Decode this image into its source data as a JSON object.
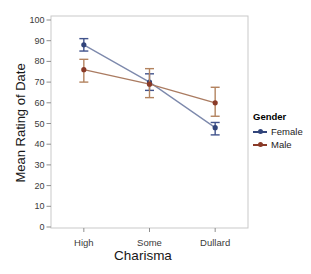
{
  "chart_data": {
    "type": "line",
    "title": "",
    "xlabel": "Charisma",
    "ylabel": "Mean Rating of Date",
    "categories": [
      "High",
      "Some",
      "Dullard"
    ],
    "ylim": [
      0,
      100
    ],
    "yticks": [
      0,
      10,
      20,
      30,
      40,
      50,
      60,
      70,
      80,
      90,
      100
    ],
    "grid": false,
    "legend": {
      "title": "Gender",
      "position": "right-outside"
    },
    "series": [
      {
        "name": "Female",
        "values": [
          88,
          70,
          48
        ],
        "ci_low": [
          85,
          66,
          44.5
        ],
        "ci_high": [
          91,
          74,
          50.5
        ],
        "marker_color": "#31447A",
        "line_color": "#7D89AC",
        "error_color": "#41538C"
      },
      {
        "name": "Male",
        "values": [
          76,
          69,
          60
        ],
        "ci_low": [
          70,
          62.5,
          53.5
        ],
        "ci_high": [
          81,
          76.5,
          67.5
        ],
        "marker_color": "#8A3A27",
        "line_color": "#AA7B61",
        "error_color": "#B3835F"
      }
    ],
    "colors": {
      "frame": "#C9C9C9",
      "tick": "#8F8F8F",
      "tick_label": "#3A3A3A",
      "axis_title": "#171717",
      "background": "#FFFFFF"
    }
  }
}
